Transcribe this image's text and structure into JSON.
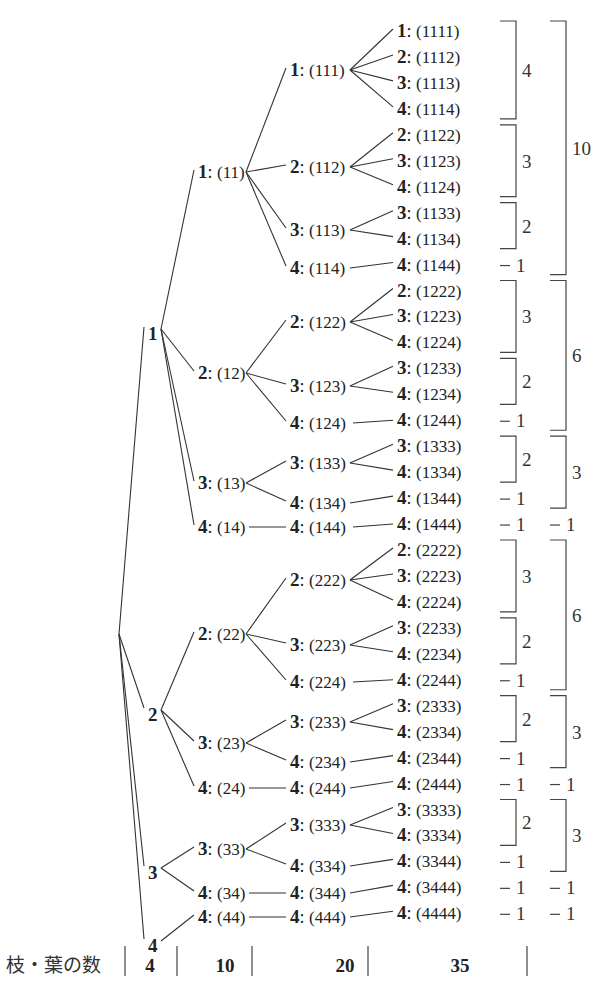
{
  "tree": {
    "root": {
      "x": 119,
      "y": 634
    },
    "leaf_rows": {
      "y0": 31,
      "dy": 25.95
    },
    "columns": {
      "level1_x": 148,
      "level2_x": 198,
      "level3_x": 290,
      "level4_x": 397,
      "count_inner_x": 516,
      "count_outer_x": 566
    },
    "leaves": [
      "1111",
      "1112",
      "1113",
      "1114",
      "1122",
      "1123",
      "1124",
      "1133",
      "1134",
      "1144",
      "1222",
      "1223",
      "1224",
      "1233",
      "1234",
      "1244",
      "1333",
      "1334",
      "1344",
      "1444",
      "2222",
      "2223",
      "2224",
      "2233",
      "2234",
      "2244",
      "2333",
      "2334",
      "2344",
      "2444",
      "3333",
      "3334",
      "3344",
      "3444",
      "4444"
    ],
    "level1": [
      {
        "digit": "1",
        "y": 333
      },
      {
        "digit": "2",
        "y": 714
      },
      {
        "digit": "3",
        "y": 872
      },
      {
        "digit": "4",
        "y": 945
      }
    ],
    "level2": [
      {
        "digit": "1",
        "seq": "11",
        "y": 172
      },
      {
        "digit": "2",
        "seq": "12",
        "y": 373
      },
      {
        "digit": "3",
        "seq": "13",
        "y": 483
      },
      {
        "digit": "4",
        "seq": "14",
        "y": 527
      },
      {
        "digit": "2",
        "seq": "22",
        "y": 634
      },
      {
        "digit": "3",
        "seq": "23",
        "y": 743
      },
      {
        "digit": "4",
        "seq": "24",
        "y": 788
      },
      {
        "digit": "3",
        "seq": "33",
        "y": 849
      },
      {
        "digit": "4",
        "seq": "34",
        "y": 893
      },
      {
        "digit": "4",
        "seq": "44",
        "y": 917
      }
    ],
    "level3": [
      {
        "digit": "1",
        "seq": "111",
        "y": 70
      },
      {
        "digit": "2",
        "seq": "112",
        "y": 167
      },
      {
        "digit": "3",
        "seq": "113",
        "y": 230
      },
      {
        "digit": "4",
        "seq": "114",
        "y": 268
      },
      {
        "digit": "2",
        "seq": "122",
        "y": 322
      },
      {
        "digit": "3",
        "seq": "123",
        "y": 386
      },
      {
        "digit": "4",
        "seq": "124",
        "y": 423
      },
      {
        "digit": "3",
        "seq": "133",
        "y": 463
      },
      {
        "digit": "4",
        "seq": "134",
        "y": 503
      },
      {
        "digit": "4",
        "seq": "144",
        "y": 527
      },
      {
        "digit": "2",
        "seq": "222",
        "y": 580
      },
      {
        "digit": "3",
        "seq": "223",
        "y": 645
      },
      {
        "digit": "4",
        "seq": "224",
        "y": 682
      },
      {
        "digit": "3",
        "seq": "233",
        "y": 722
      },
      {
        "digit": "4",
        "seq": "234",
        "y": 762
      },
      {
        "digit": "4",
        "seq": "244",
        "y": 788
      },
      {
        "digit": "3",
        "seq": "333",
        "y": 825
      },
      {
        "digit": "4",
        "seq": "334",
        "y": 866
      },
      {
        "digit": "4",
        "seq": "344",
        "y": 893
      },
      {
        "digit": "4",
        "seq": "444",
        "y": 917
      }
    ],
    "edges_l1_to_l2": [
      [
        0,
        0
      ],
      [
        0,
        1
      ],
      [
        0,
        2
      ],
      [
        0,
        3
      ],
      [
        1,
        4
      ],
      [
        1,
        5
      ],
      [
        1,
        6
      ],
      [
        2,
        7
      ],
      [
        2,
        8
      ],
      [
        3,
        9
      ]
    ],
    "edges_l2_to_l3": [
      [
        0,
        0
      ],
      [
        0,
        1
      ],
      [
        0,
        2
      ],
      [
        0,
        3
      ],
      [
        1,
        4
      ],
      [
        1,
        5
      ],
      [
        1,
        6
      ],
      [
        2,
        7
      ],
      [
        2,
        8
      ],
      [
        3,
        9
      ],
      [
        4,
        10
      ],
      [
        4,
        11
      ],
      [
        4,
        12
      ],
      [
        5,
        13
      ],
      [
        5,
        14
      ],
      [
        6,
        15
      ],
      [
        7,
        16
      ],
      [
        7,
        17
      ],
      [
        8,
        18
      ],
      [
        9,
        19
      ]
    ],
    "edges_l3_to_leaf": [
      [
        0,
        0
      ],
      [
        0,
        1
      ],
      [
        0,
        2
      ],
      [
        0,
        3
      ],
      [
        1,
        4
      ],
      [
        1,
        5
      ],
      [
        1,
        6
      ],
      [
        2,
        7
      ],
      [
        2,
        8
      ],
      [
        3,
        9
      ],
      [
        4,
        10
      ],
      [
        4,
        11
      ],
      [
        4,
        12
      ],
      [
        5,
        13
      ],
      [
        5,
        14
      ],
      [
        6,
        15
      ],
      [
        7,
        16
      ],
      [
        7,
        17
      ],
      [
        8,
        18
      ],
      [
        9,
        19
      ],
      [
        10,
        20
      ],
      [
        10,
        21
      ],
      [
        10,
        22
      ],
      [
        11,
        23
      ],
      [
        11,
        24
      ],
      [
        12,
        25
      ],
      [
        13,
        26
      ],
      [
        13,
        27
      ],
      [
        14,
        28
      ],
      [
        15,
        29
      ],
      [
        16,
        30
      ],
      [
        16,
        31
      ],
      [
        17,
        32
      ],
      [
        18,
        33
      ],
      [
        19,
        34
      ]
    ]
  },
  "counts": {
    "inner": [
      {
        "from": 0,
        "to": 3,
        "value": "4",
        "type": "bracket"
      },
      {
        "from": 4,
        "to": 6,
        "value": "3",
        "type": "bracket"
      },
      {
        "from": 7,
        "to": 8,
        "value": "2",
        "type": "bracket"
      },
      {
        "from": 9,
        "to": 9,
        "value": "1",
        "type": "dash"
      },
      {
        "from": 10,
        "to": 12,
        "value": "3",
        "type": "bracket"
      },
      {
        "from": 13,
        "to": 14,
        "value": "2",
        "type": "bracket"
      },
      {
        "from": 15,
        "to": 15,
        "value": "1",
        "type": "dash"
      },
      {
        "from": 16,
        "to": 17,
        "value": "2",
        "type": "bracket"
      },
      {
        "from": 18,
        "to": 18,
        "value": "1",
        "type": "dash"
      },
      {
        "from": 19,
        "to": 19,
        "value": "1",
        "type": "dash"
      },
      {
        "from": 20,
        "to": 22,
        "value": "3",
        "type": "bracket"
      },
      {
        "from": 23,
        "to": 24,
        "value": "2",
        "type": "bracket"
      },
      {
        "from": 25,
        "to": 25,
        "value": "1",
        "type": "dash"
      },
      {
        "from": 26,
        "to": 27,
        "value": "2",
        "type": "bracket"
      },
      {
        "from": 28,
        "to": 28,
        "value": "1",
        "type": "dash"
      },
      {
        "from": 29,
        "to": 29,
        "value": "1",
        "type": "dash"
      },
      {
        "from": 30,
        "to": 31,
        "value": "2",
        "type": "bracket"
      },
      {
        "from": 32,
        "to": 32,
        "value": "1",
        "type": "dash"
      },
      {
        "from": 33,
        "to": 33,
        "value": "1",
        "type": "dash"
      },
      {
        "from": 34,
        "to": 34,
        "value": "1",
        "type": "dash"
      }
    ],
    "outer": [
      {
        "from": 0,
        "to": 9,
        "value": "10",
        "type": "bracket"
      },
      {
        "from": 10,
        "to": 15,
        "value": "6",
        "type": "bracket"
      },
      {
        "from": 16,
        "to": 18,
        "value": "3",
        "type": "bracket"
      },
      {
        "from": 19,
        "to": 19,
        "value": "1",
        "type": "dash"
      },
      {
        "from": 20,
        "to": 25,
        "value": "6",
        "type": "bracket"
      },
      {
        "from": 26,
        "to": 28,
        "value": "3",
        "type": "bracket"
      },
      {
        "from": 29,
        "to": 29,
        "value": "1",
        "type": "dash"
      },
      {
        "from": 30,
        "to": 32,
        "value": "3",
        "type": "bracket"
      },
      {
        "from": 33,
        "to": 33,
        "value": "1",
        "type": "dash"
      },
      {
        "from": 34,
        "to": 34,
        "value": "1",
        "type": "dash"
      }
    ]
  },
  "footer": {
    "label": "枝・葉の数",
    "values": [
      "4",
      "10",
      "20",
      "35"
    ],
    "y": 966,
    "value_x": [
      150,
      225,
      345,
      460
    ],
    "divider_x": [
      125,
      177,
      252,
      368,
      527
    ]
  }
}
